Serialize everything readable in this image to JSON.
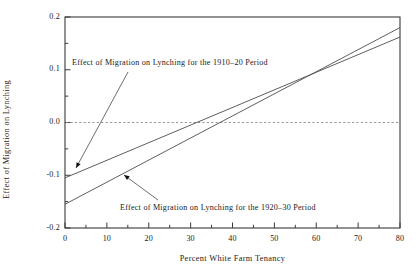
{
  "chart_data": {
    "type": "line",
    "title": "",
    "xlabel": "Percent White Farm Tenancy",
    "ylabel": "Effect of Migration on Lynching",
    "xlim": [
      0,
      80
    ],
    "ylim": [
      -0.2,
      0.2
    ],
    "grid": false,
    "legend_position": "none",
    "xticks": [
      0,
      10,
      20,
      30,
      40,
      50,
      60,
      70,
      80
    ],
    "xtick_labels": [
      "0",
      "10",
      "20",
      "30",
      "40",
      "50",
      "60",
      "70",
      "80"
    ],
    "xminor_ticks": [
      5,
      15,
      25,
      35,
      45,
      55,
      65,
      75
    ],
    "yticks": [
      -0.2,
      -0.1,
      0.0,
      0.1,
      0.2
    ],
    "ytick_labels": [
      "-0.2",
      "-0.1",
      "0.0",
      "0.1",
      "0.2"
    ],
    "yminor_ticks": [
      -0.15,
      -0.05,
      0.05,
      0.15
    ],
    "reference_line": {
      "y": 0.0,
      "style": "dashed",
      "color": "#8a8a8a"
    },
    "series": [
      {
        "name": "Effect of Migration on Lynching for the 1910-20 Period",
        "color": "#555555",
        "x": [
          0,
          80
        ],
        "values": [
          -0.105,
          0.162
        ]
      },
      {
        "name": "Effect of Migration on Lynching for the 1920-30 Period",
        "color": "#555555",
        "x": [
          0,
          80
        ],
        "values": [
          -0.155,
          0.18
        ]
      }
    ],
    "annotations": [
      {
        "text": "Effect of Migration on Lynching for the 1910–20 Period",
        "text_x_px": 72,
        "text_y_px": 58,
        "arrow_from_px": [
          128,
          72
        ],
        "arrow_to_px": [
          76,
          168
        ]
      },
      {
        "text": "Effect of Migration on Lynching for the 1920–30 Period",
        "text_x_px": 120,
        "text_y_px": 203,
        "arrow_from_px": [
          158,
          200
        ],
        "arrow_to_px": [
          124,
          175
        ]
      }
    ]
  },
  "figure": {
    "frame_color": "#3a3a3a",
    "background": "#ffffff"
  }
}
